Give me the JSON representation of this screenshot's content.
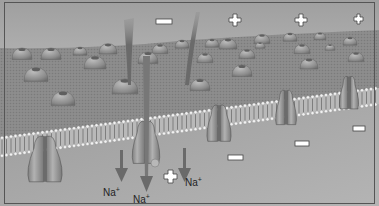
{
  "figure": {
    "colors": {
      "extracellular_top": "#a9a9a9",
      "extracellular_bottom": "#d2d2d2",
      "membrane_surface": "#8e8e8e",
      "intracellular": "#a6a6a6",
      "protein": "#8a8a8a",
      "protein_highlight": "#b5b5b5",
      "arrow": "#6c6c6c",
      "marker_fill": "#ffffff",
      "marker_stroke": "#444444"
    },
    "charge_markers": {
      "outside": [
        "-",
        "+",
        "+",
        "+"
      ],
      "inside": [
        "+",
        "-",
        "-",
        "-"
      ]
    },
    "ion_labels": [
      "Na+",
      "Na+",
      "Na+"
    ],
    "ion_symbol": "Na",
    "ion_charge": "+"
  }
}
